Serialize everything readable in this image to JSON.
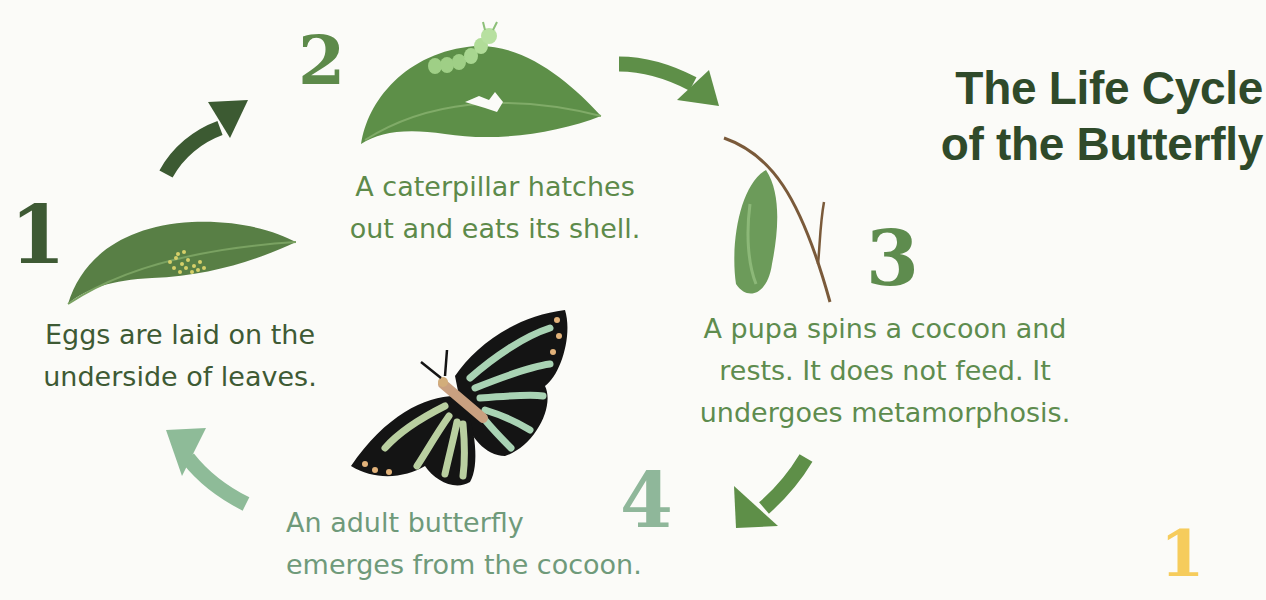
{
  "title": {
    "line1": "The Life Cycle",
    "line2": "of the Butterfly"
  },
  "stages": [
    {
      "number": "1",
      "caption_lines": [
        "Eggs are laid on the",
        "underside of leaves."
      ],
      "image": "leaf-with-eggs"
    },
    {
      "number": "2",
      "caption_lines": [
        "A caterpillar hatches",
        "out and eats its shell."
      ],
      "image": "leaf-with-caterpillar"
    },
    {
      "number": "3",
      "caption_lines": [
        "A pupa spins a cocoon and",
        "rests. It does not feed. It",
        "undergoes metamorphosis."
      ],
      "image": "cocoon-on-twig"
    },
    {
      "number": "4",
      "caption_lines": [
        "An adult butterfly",
        "emerges from the cocoon."
      ],
      "image": "butterfly"
    }
  ],
  "arrows": [
    "arrow-1-to-2",
    "arrow-2-to-3",
    "arrow-3-to-4",
    "arrow-4-to-1"
  ],
  "page_number": "1",
  "colors": {
    "title": "#2f4a2a",
    "stage1": "#3e5a34",
    "stage2": "#5d8a4a",
    "stage3": "#5e8c4e",
    "stage4": "#8fb79a",
    "page_number": "#f6cc5c",
    "arrow_dark": "#3c5a32",
    "arrow_mid": "#5e8f48",
    "arrow_light": "#8ebb98"
  }
}
